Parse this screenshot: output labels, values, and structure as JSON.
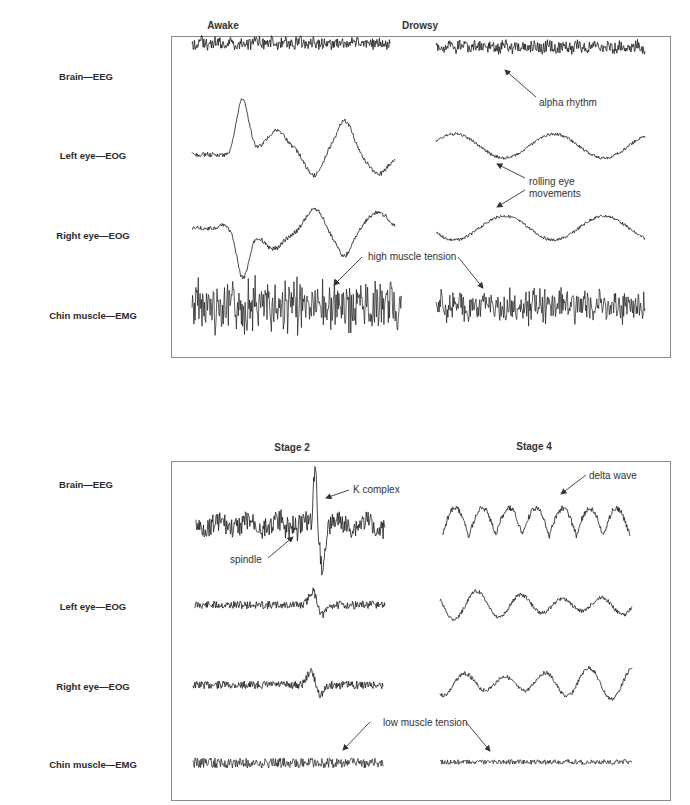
{
  "figure": {
    "row_labels": [
      "Brain—EEG",
      "Left eye—EOG",
      "Right eye—EOG",
      "Chin muscle—EMG"
    ],
    "top_panel": {
      "columns": [
        "Awake",
        "Drowsy"
      ],
      "annotations": {
        "alpha": "alpha rhythm",
        "rolling_line1": "rolling eye",
        "rolling_line2": "movements",
        "muscle": "high muscle tension"
      }
    },
    "bottom_panel": {
      "columns": [
        "Stage 2",
        "Stage 4"
      ],
      "annotations": {
        "k_complex": "K complex",
        "spindle": "spindle",
        "delta": "delta wave",
        "muscle": "low muscle tension"
      }
    }
  },
  "colors": {
    "trace": "#1a1a1a",
    "border": "#8a8a8a",
    "arrow": "#333333",
    "text": "#2a2a2a"
  },
  "traces": [
    {
      "x0": 192,
      "x1": 390,
      "y": 43,
      "amp": 6,
      "noise": 1,
      "seed": 1,
      "type": "eeg_fast"
    },
    {
      "x0": 436,
      "x1": 645,
      "y": 47,
      "amp": 6,
      "noise": 1,
      "seed": 2,
      "type": "eeg_fast"
    },
    {
      "x0": 192,
      "x1": 395,
      "y": 153,
      "amp": 30,
      "noise": 0.5,
      "seed": 3,
      "type": "eog_awake_left"
    },
    {
      "x0": 436,
      "x1": 645,
      "y": 146,
      "amp": 12,
      "noise": 0.4,
      "seed": 4,
      "type": "eog_roll_left"
    },
    {
      "x0": 192,
      "x1": 395,
      "y": 228,
      "amp": 30,
      "noise": 0.5,
      "seed": 5,
      "type": "eog_awake_right"
    },
    {
      "x0": 436,
      "x1": 645,
      "y": 228,
      "amp": 12,
      "noise": 0.4,
      "seed": 6,
      "type": "eog_roll_right"
    },
    {
      "x0": 192,
      "x1": 402,
      "y": 306,
      "amp": 22,
      "noise": 1,
      "seed": 7,
      "type": "emg_high"
    },
    {
      "x0": 436,
      "x1": 645,
      "y": 306,
      "amp": 14,
      "noise": 1,
      "seed": 8,
      "type": "emg_high"
    },
    {
      "x0": 196,
      "x1": 385,
      "y": 525,
      "amp": 10,
      "noise": 0.6,
      "seed": 9,
      "type": "eeg_stage2"
    },
    {
      "x0": 442,
      "x1": 630,
      "y": 525,
      "amp": 28,
      "noise": 0.4,
      "seed": 10,
      "type": "delta"
    },
    {
      "x0": 195,
      "x1": 385,
      "y": 605,
      "amp": 4,
      "noise": 0.5,
      "seed": 11,
      "type": "eog_stage2"
    },
    {
      "x0": 440,
      "x1": 632,
      "y": 605,
      "amp": 14,
      "noise": 0.4,
      "seed": 12,
      "type": "eog_stage4"
    },
    {
      "x0": 193,
      "x1": 383,
      "y": 685,
      "amp": 4,
      "noise": 0.5,
      "seed": 13,
      "type": "eog_stage2"
    },
    {
      "x0": 440,
      "x1": 632,
      "y": 683,
      "amp": 16,
      "noise": 0.4,
      "seed": 14,
      "type": "eog_stage4"
    },
    {
      "x0": 193,
      "x1": 383,
      "y": 763,
      "amp": 5,
      "noise": 1,
      "seed": 15,
      "type": "emg_low"
    },
    {
      "x0": 440,
      "x1": 632,
      "y": 762,
      "amp": 2.5,
      "noise": 1,
      "seed": 16,
      "type": "emg_low"
    }
  ]
}
